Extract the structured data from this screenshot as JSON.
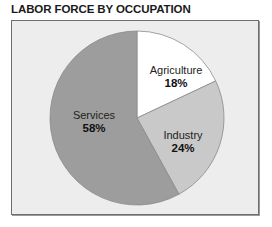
{
  "title": "LABOR FORCE BY OCCUPATION",
  "colors": {
    "background": "#ededed",
    "agriculture": "#ffffff",
    "industry": "#c9c9c9",
    "services": "#9d9d9d",
    "stroke": "#8a8a8a"
  },
  "slices": [
    {
      "label": "Agriculture",
      "pct_label": "18%"
    },
    {
      "label": "Industry",
      "pct_label": "24%"
    },
    {
      "label": "Services",
      "pct_label": "58%"
    }
  ],
  "chart_data": {
    "type": "pie",
    "title": "LABOR FORCE BY OCCUPATION",
    "categories": [
      "Agriculture",
      "Industry",
      "Services"
    ],
    "values": [
      18,
      24,
      58
    ],
    "unit": "%",
    "start_angle": "12 o'clock, clockwise",
    "legend": "none (labels inside slices)"
  }
}
